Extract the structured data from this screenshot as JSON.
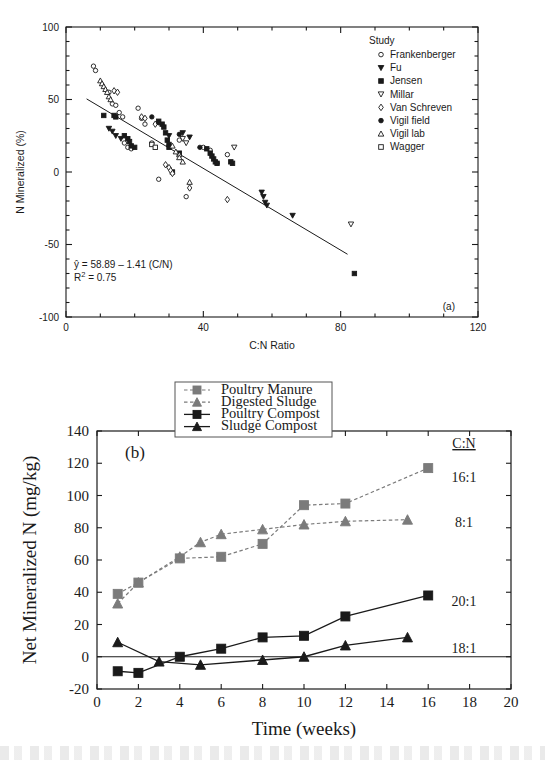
{
  "figure": {
    "background": "#ffffff",
    "ink": "#1a1a1a",
    "gray_series": "#7b7b7b"
  },
  "panel_a": {
    "label": "(a)",
    "legend_title": "Study",
    "annotation_equation": "ŷ = 58.89 – 1.41 (C/N)",
    "annotation_r2_prefix": "R",
    "annotation_r2_sup": "2",
    "annotation_r2_value": " = 0.75",
    "legend_items": [
      {
        "label": "Frankenberger",
        "marker": "open-circle"
      },
      {
        "label": "Fu",
        "marker": "filled-down-triangle"
      },
      {
        "label": "Jensen",
        "marker": "filled-square"
      },
      {
        "label": "Millar",
        "marker": "open-down-triangle"
      },
      {
        "label": "Van Schreven",
        "marker": "open-diamond"
      },
      {
        "label": "Vigil field",
        "marker": "filled-circle"
      },
      {
        "label": "Vigil lab",
        "marker": "open-up-triangle"
      },
      {
        "label": "Wagger",
        "marker": "open-square"
      }
    ]
  },
  "panel_b": {
    "label": "(b)",
    "cn_header": "C:N",
    "cn_values": [
      "16:1",
      "8:1",
      "20:1",
      "18:1"
    ],
    "legend_items": [
      {
        "label": "Poultry Manure",
        "marker": "filled-square",
        "color": "#7b7b7b",
        "dash": true
      },
      {
        "label": "Digested Sludge",
        "marker": "filled-up-triangle",
        "color": "#7b7b7b",
        "dash": true
      },
      {
        "label": "Poultry Compost",
        "marker": "filled-square",
        "color": "#1a1a1a",
        "dash": false
      },
      {
        "label": "Sludge Compost",
        "marker": "filled-up-triangle",
        "color": "#1a1a1a",
        "dash": false
      }
    ]
  },
  "chart_data": [
    {
      "type": "scatter",
      "panel": "(a)",
      "title": "",
      "xlabel": "C:N Ratio",
      "ylabel": "N Mineralized (%)",
      "xlim": [
        0,
        120
      ],
      "ylim": [
        -100,
        100
      ],
      "xticks": [
        0,
        40,
        80,
        120
      ],
      "xticks_minor_step": 10,
      "yticks": [
        -100,
        -50,
        0,
        50,
        100
      ],
      "yticks_minor_step": 10,
      "grid": false,
      "legend_position": "top-right",
      "annotations": [
        "ŷ = 58.89 – 1.41 (C/N)",
        "R2 = 0.75",
        "(a)"
      ],
      "fit_line": {
        "intercept": 58.89,
        "slope": -1.41,
        "r2": 0.75,
        "x_from": 6,
        "x_to": 82
      },
      "series": [
        {
          "name": "Frankenberger",
          "marker": "open-circle",
          "points": [
            [
              8,
              73
            ],
            [
              8.6,
              70
            ],
            [
              12.5,
              55
            ],
            [
              13.5,
              47
            ],
            [
              14.5,
              46
            ],
            [
              15.5,
              41
            ],
            [
              16.5,
              38
            ],
            [
              17,
              20
            ],
            [
              18,
              17
            ],
            [
              19,
              16
            ],
            [
              21,
              44
            ],
            [
              22,
              37
            ],
            [
              23,
              33
            ],
            [
              25,
              20
            ],
            [
              27,
              -5
            ],
            [
              33,
              22
            ],
            [
              35,
              -17
            ],
            [
              40,
              17
            ],
            [
              42,
              15
            ],
            [
              47,
              12
            ]
          ]
        },
        {
          "name": "Fu",
          "marker": "filled-down-triangle",
          "points": [
            [
              12.5,
              30
            ],
            [
              13.5,
              28
            ],
            [
              14.5,
              25
            ],
            [
              16,
              23
            ],
            [
              30,
              25
            ],
            [
              34,
              27
            ],
            [
              36,
              24
            ],
            [
              57,
              -14
            ],
            [
              57.5,
              -17
            ],
            [
              58,
              -21
            ],
            [
              58.5,
              -23
            ],
            [
              66,
              -30
            ]
          ]
        },
        {
          "name": "Jensen",
          "marker": "filled-square",
          "points": [
            [
              11,
              39
            ],
            [
              14,
              39
            ],
            [
              14.5,
              38
            ],
            [
              17,
              25
            ],
            [
              18,
              23
            ],
            [
              18.5,
              21
            ],
            [
              19,
              18
            ],
            [
              20,
              17
            ],
            [
              27,
              35
            ],
            [
              28,
              33
            ],
            [
              28.5,
              31
            ],
            [
              29,
              27
            ],
            [
              29.5,
              22
            ],
            [
              30,
              19
            ],
            [
              30,
              17
            ],
            [
              31,
              0
            ],
            [
              33,
              13
            ],
            [
              41,
              16
            ],
            [
              42,
              13
            ],
            [
              42.5,
              11
            ],
            [
              43,
              9
            ],
            [
              43.5,
              7
            ],
            [
              44,
              6
            ],
            [
              48,
              7
            ],
            [
              48.5,
              6
            ],
            [
              84,
              -70
            ]
          ]
        },
        {
          "name": "Millar",
          "marker": "open-down-triangle",
          "points": [
            [
              34,
              23
            ],
            [
              35,
              20
            ],
            [
              49,
              17
            ],
            [
              83,
              -36
            ]
          ]
        },
        {
          "name": "Van Schreven",
          "marker": "open-diamond",
          "points": [
            [
              14,
              56
            ],
            [
              15,
              55
            ],
            [
              22,
              38
            ],
            [
              23,
              37
            ],
            [
              26,
              33
            ],
            [
              29,
              5
            ],
            [
              30,
              3
            ],
            [
              30.5,
              1
            ],
            [
              31,
              -1
            ],
            [
              36,
              -11
            ],
            [
              47,
              -19
            ]
          ]
        },
        {
          "name": "Vigil field",
          "marker": "filled-circle",
          "points": [
            [
              25,
              38
            ],
            [
              27,
              34
            ],
            [
              33,
              26
            ],
            [
              39,
              17
            ],
            [
              44,
              6
            ]
          ]
        },
        {
          "name": "Vigil lab",
          "marker": "open-up-triangle",
          "points": [
            [
              10,
              63
            ],
            [
              10.5,
              61
            ],
            [
              11,
              59
            ],
            [
              11.5,
              57
            ],
            [
              12,
              55
            ],
            [
              12.5,
              52
            ],
            [
              13,
              50
            ],
            [
              31,
              18
            ],
            [
              32,
              14
            ],
            [
              33,
              12
            ],
            [
              33,
              10
            ],
            [
              34,
              7
            ],
            [
              36,
              -7
            ]
          ]
        },
        {
          "name": "Wagger",
          "marker": "open-square",
          "points": [
            [
              25,
              19
            ],
            [
              26,
              17
            ]
          ]
        }
      ]
    },
    {
      "type": "line",
      "panel": "(b)",
      "title": "",
      "xlabel": "Time (weeks)",
      "ylabel": "Net Mineralized N (mg/kg)",
      "xlim": [
        0,
        20
      ],
      "ylim": [
        -20,
        140
      ],
      "xticks": [
        0,
        2,
        4,
        6,
        8,
        10,
        12,
        14,
        16,
        18,
        20
      ],
      "yticks": [
        -20,
        0,
        20,
        40,
        60,
        80,
        100,
        120,
        140
      ],
      "grid": false,
      "legend_position": "top-center",
      "zero_line": true,
      "series": [
        {
          "name": "Poultry Manure",
          "cn": "16:1",
          "marker": "filled-square",
          "color": "#7b7b7b",
          "dash": true,
          "x": [
            1,
            2,
            4,
            6,
            8,
            10,
            12,
            16
          ],
          "y": [
            39,
            46,
            61,
            62,
            70,
            94,
            95,
            117
          ]
        },
        {
          "name": "Digested Sludge",
          "cn": "8:1",
          "marker": "filled-up-triangle",
          "color": "#7b7b7b",
          "dash": true,
          "x": [
            1,
            2,
            4,
            5,
            6,
            8,
            10,
            12,
            15
          ],
          "y": [
            33,
            46,
            62,
            71,
            76,
            79,
            82,
            84,
            85
          ]
        },
        {
          "name": "Poultry Compost",
          "cn": "20:1",
          "marker": "filled-square",
          "color": "#1a1a1a",
          "dash": false,
          "x": [
            1,
            2,
            4,
            6,
            8,
            10,
            12,
            16
          ],
          "y": [
            -9,
            -10,
            0,
            5,
            12,
            13,
            25,
            38
          ]
        },
        {
          "name": "Sludge Compost",
          "cn": "18:1",
          "marker": "filled-up-triangle",
          "color": "#1a1a1a",
          "dash": false,
          "x": [
            1,
            3,
            5,
            8,
            10,
            12,
            15
          ],
          "y": [
            9,
            -3,
            -5,
            -2,
            0,
            7,
            12
          ]
        }
      ]
    }
  ]
}
